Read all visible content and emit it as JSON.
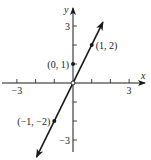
{
  "chart_data": {
    "type": "line",
    "title": "",
    "xlabel": "x",
    "ylabel": "y",
    "xlim": [
      -3,
      3
    ],
    "ylim": [
      -3,
      3
    ],
    "grid": false,
    "equation": "y = 2x + 1",
    "x_ticks": [
      -3,
      -2,
      -1,
      1,
      2,
      3
    ],
    "x_tick_labels": [
      {
        "value": -3,
        "label": "−3"
      },
      {
        "value": 3,
        "label": "3"
      }
    ],
    "y_ticks": [
      -3,
      -2,
      -1,
      1,
      2,
      3
    ],
    "y_tick_labels": [
      {
        "value": 3,
        "label": "3"
      },
      {
        "value": -3,
        "label": "−3"
      }
    ],
    "series": [
      {
        "name": "line",
        "x": [
          -1.95,
          1.6
        ],
        "y": [
          -3.9,
          3.2
        ],
        "arrows": "both"
      }
    ],
    "points": [
      {
        "x": 0,
        "y": 1,
        "label": "(0, 1)",
        "label_side": "left"
      },
      {
        "x": 1,
        "y": 2,
        "label": "(1, 2)",
        "label_side": "right"
      },
      {
        "x": -1,
        "y": -2,
        "label": "(−1, −2)",
        "label_side": "left"
      }
    ],
    "origin_marker": {
      "x": 0,
      "y": 0,
      "style": "open-circle"
    }
  }
}
